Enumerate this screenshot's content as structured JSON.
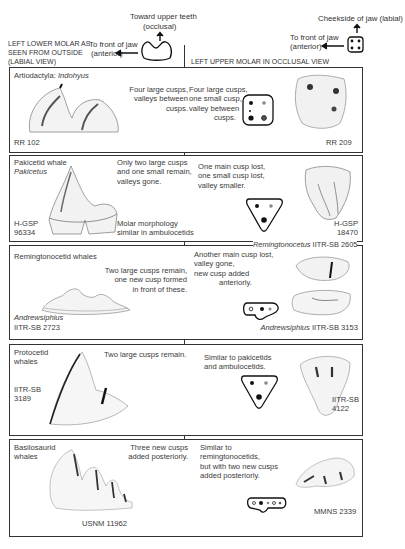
{
  "header": {
    "occlusal_label": "Toward upper teeth",
    "occlusal_sub": "(occlusal)",
    "left_title_1": "LEFT LOWER MOLAR AS",
    "left_title_2": "SEEN FROM OUTSIDE",
    "left_title_3": "(LABIAL VIEW)",
    "left_anterior_1": "To front of jaw",
    "left_anterior_2": "(anterior)",
    "right_labial": "Cheekside of jaw (labial)",
    "right_anterior_1": "To front of jaw",
    "right_anterior_2": "(anterior)",
    "right_title": "LEFT UPPER MOLAR IN OCCLUSAL VIEW"
  },
  "rows": [
    {
      "group": "Artiodactyla:",
      "taxon": "Indohyus",
      "lower_desc": [
        "Four large cusps,",
        "valleys between",
        "cusps."
      ],
      "lower_specimen": "RR 102",
      "upper_desc": [
        "Four large cusps,",
        "one small cusp,",
        "valley between",
        "cusps."
      ],
      "upper_specimen": "RR 209"
    },
    {
      "group": "Pakicetid whale",
      "taxon": "Pakicetus",
      "lower_desc": [
        "Only two large cusps",
        "and one small remain,",
        "valleys gone."
      ],
      "lower_specimen_1": "H-GSP",
      "lower_specimen_2": "96334",
      "lower_note": [
        "Molar morphology",
        "similar in ambulocetids"
      ],
      "upper_desc": [
        "One main cusp lost,",
        "one small cusp lost,",
        "valley smaller."
      ],
      "upper_specimen_1": "H-GSP",
      "upper_specimen_2": "18470"
    },
    {
      "group": "Remingtonocetid whales",
      "lower_desc": [
        "Two large cusps remain,",
        "one new cusp formed",
        "in front of these."
      ],
      "lower_taxon": "Andrewsiphius",
      "lower_specimen": "IITR-SB 2723",
      "upper_desc": [
        "Another main cusp lost,",
        "valley gone,",
        "new cusp added",
        "anteriorly."
      ],
      "upper_top_taxon": "Remingtonocetus",
      "upper_top_specimen": "IITR-SB 2605",
      "upper_bottom_taxon": "Andrewsiphius",
      "upper_bottom_specimen": "IITR-SB 3153"
    },
    {
      "group_1": "Protocetid",
      "group_2": "whales",
      "lower_desc": [
        "Two large cusps remain."
      ],
      "lower_specimen_1": "IITR-SB",
      "lower_specimen_2": "3189",
      "upper_desc": [
        "Similar to pakicetids",
        "and ambulocetids."
      ],
      "upper_specimen_1": "IITR-SB",
      "upper_specimen_2": "4122"
    },
    {
      "group_1": "Basilosaurid",
      "group_2": "whales",
      "lower_desc": [
        "Three new cusps",
        "added posteriorly."
      ],
      "lower_specimen": "USNM 11962",
      "upper_desc": [
        "Similar to",
        "remingtonocetids,",
        "but with two new cusps",
        "added posteriorly."
      ],
      "upper_specimen": "MMNS 2339"
    }
  ],
  "colors": {
    "border": "#333333",
    "text": "#3a3a3a",
    "cusp_large": "#111111",
    "cusp_small": "#888888"
  }
}
